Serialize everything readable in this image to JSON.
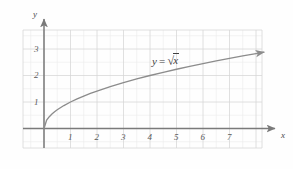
{
  "chart_data": {
    "type": "line",
    "title": "",
    "subtitle": "",
    "function_label": "y = √x",
    "function_expression": "y = sqrt(x)",
    "xlabel": "x",
    "ylabel": "y",
    "xlim": [
      -0.8,
      8.85
    ],
    "ylim": [
      -0.75,
      3.72
    ],
    "xticks": [
      1,
      2,
      3,
      4,
      5,
      6,
      7
    ],
    "yticks": [
      1,
      2,
      3
    ],
    "xtick_labels": [
      "1",
      "2",
      "3",
      "4",
      "5",
      "6",
      "7"
    ],
    "ytick_labels": [
      "1",
      "2",
      "3"
    ],
    "grid": true,
    "grid_major_step": 1,
    "grid_minor_step": 0.5,
    "legend": "none",
    "x": [
      0,
      0.1,
      0.2,
      0.3,
      0.4,
      0.5,
      0.75,
      1,
      1.25,
      1.5,
      1.75,
      2,
      2.5,
      3,
      3.5,
      4,
      4.5,
      5,
      5.5,
      6,
      6.5,
      7,
      7.5,
      8,
      8.3
    ],
    "y": [
      0,
      0.316,
      0.447,
      0.548,
      0.632,
      0.707,
      0.866,
      1,
      1.118,
      1.225,
      1.323,
      1.414,
      1.581,
      1.732,
      1.871,
      2,
      2.121,
      2.236,
      2.345,
      2.449,
      2.55,
      2.646,
      2.739,
      2.828,
      2.881
    ],
    "series": [
      {
        "name": "y = √x",
        "values": [
          0,
          0.316,
          0.447,
          0.548,
          0.632,
          0.707,
          0.866,
          1,
          1.118,
          1.225,
          1.323,
          1.414,
          1.581,
          1.732,
          1.871,
          2,
          2.121,
          2.236,
          2.345,
          2.449,
          2.55,
          2.646,
          2.739,
          2.828,
          2.881
        ]
      }
    ],
    "annotations": [
      {
        "text": "y = √x",
        "x": 4.3,
        "y": 2.6
      }
    ],
    "colors": {
      "curve": "#8c8c8c",
      "axis": "#7a7a7a",
      "grid_major": "#d8d8d8",
      "grid_minor": "#ececec",
      "text": "#4a4a4a",
      "background": "#fefefe"
    }
  },
  "axes": {
    "x_axis_name": "x",
    "y_axis_name": "y"
  },
  "ticks": {
    "x": [
      {
        "label": "1"
      },
      {
        "label": "2"
      },
      {
        "label": "3"
      },
      {
        "label": "4"
      },
      {
        "label": "5"
      },
      {
        "label": "6"
      },
      {
        "label": "7"
      }
    ],
    "y": [
      {
        "label": "3"
      },
      {
        "label": "2"
      },
      {
        "label": "1"
      }
    ]
  },
  "curve_label": {
    "lhs": "y",
    "equals": "=",
    "radical_sign": "√",
    "radicand": "x"
  }
}
